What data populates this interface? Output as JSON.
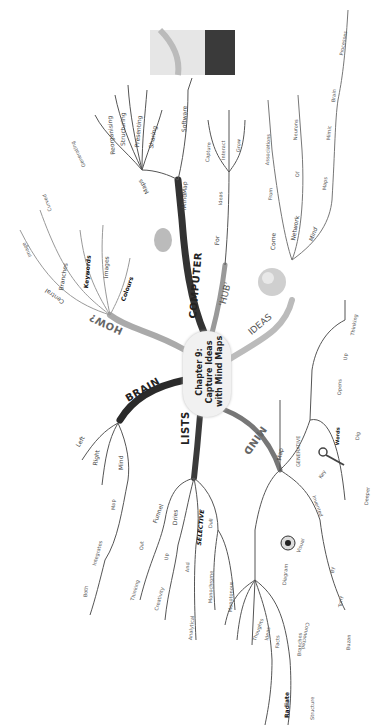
{
  "center": {
    "line1": "Chapter 9:",
    "line2": "Capture Ideas",
    "line3": "with Mind Maps"
  },
  "colors": {
    "computer": "#333333",
    "brain": "#2a2a2a",
    "lists": "#3a3a3a",
    "mind": "#777777",
    "how": "#aaaaaa",
    "hub": "#999999",
    "ideas": "#bbbbbb",
    "line": "#555555"
  },
  "branches": {
    "computer": {
      "label": "COMPUTER",
      "imindmap": "iMindMap",
      "software": "Software",
      "maps": "Maps",
      "maps_children": [
        "Generating",
        "Reorganising",
        "Structuring",
        "Presenting",
        "Sharing"
      ]
    },
    "how": {
      "label": "HOW?",
      "children": [
        "Central",
        "Image",
        "Curved",
        "Branches",
        "Keywords",
        "Images",
        "Colours"
      ]
    },
    "hub": {
      "label": "'HUB'",
      "for": "For",
      "ideas": "Ideas",
      "children": [
        "Capture",
        "Interact",
        "Grow"
      ]
    },
    "ideas": {
      "label": "IDEAS",
      "come": "Come",
      "from": "From",
      "associations": "Associations",
      "network": "Network",
      "of": "Of",
      "neurons": "Neurons",
      "mind": "Mind",
      "maps": "Maps",
      "mimic": "Mimic",
      "brain": "Brain",
      "processes": "Processes"
    },
    "brain": {
      "label": "BRAIN",
      "left": "Left",
      "right": "Right",
      "mind": "Mind",
      "map": "Map",
      "integrates": "Integrates",
      "both": "Both"
    },
    "lists": {
      "label": "LISTS",
      "funnel": "Funnel",
      "out": "Out",
      "thinking": "Thinking",
      "dries": "Dries",
      "up": "Up",
      "creativity": "Creativity",
      "selective": "SELECTIVE",
      "and": "And",
      "analytical": "Analytical",
      "dull": "Dull",
      "monochrome": "Monochrome",
      "monotonous": "Monotonous"
    },
    "mind": {
      "label": "MIND",
      "map": "Map",
      "generative": "GENERATIVE",
      "key": "Key",
      "words": "Words",
      "opens": "Opens",
      "up": "Up",
      "thinking": "Thinking",
      "dig": "Dig",
      "deeper": "Deeper",
      "invented": "Invented",
      "by": "By",
      "tony": "Tony",
      "buzan": "Buzan",
      "visual": "Visual",
      "diagram": "Diagram",
      "diagram_children": [
        "Thoughts",
        "Ideas",
        "Facts",
        "Branches",
        "Connected"
      ],
      "radiate": "Radiate",
      "structure": "Structure"
    }
  }
}
